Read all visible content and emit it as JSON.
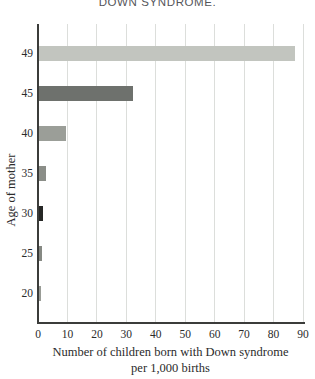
{
  "title": "DOWN SYNDROME.",
  "chart_data": {
    "type": "bar",
    "orientation": "horizontal",
    "title": "DOWN SYNDROME.",
    "categories": [
      "49",
      "45",
      "40",
      "35",
      "30",
      "25",
      "20"
    ],
    "values": [
      87,
      32,
      9,
      2.5,
      1.5,
      1,
      0.8
    ],
    "bar_colors": [
      "#c2c5bf",
      "#6e716d",
      "#9b9e98",
      "#8b8e88",
      "#262725",
      "#868983",
      "#999c96"
    ],
    "x_ticks": [
      "0",
      "10",
      "20",
      "30",
      "40",
      "50",
      "60",
      "70",
      "80",
      "90"
    ],
    "xlim": [
      0,
      90
    ],
    "xlabel_line1": "Number of children born with Down syndrome",
    "xlabel_line2": "per 1,000 births",
    "ylabel": "Age of mother",
    "grid": "vertical",
    "legend": "none",
    "gridline_color": "#dcdedb",
    "axis_color": "#3b3c3a",
    "text_color": "#2b2b2b",
    "title_color": "#55565a",
    "background_color": "#ffffff"
  }
}
